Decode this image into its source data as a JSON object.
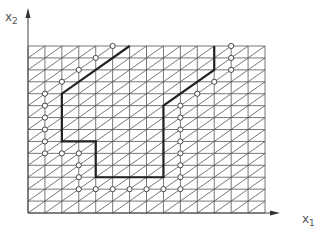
{
  "diagram": {
    "type": "triangulated-grid-with-path",
    "axes": {
      "x_label": "x",
      "x_sub": "1",
      "y_label": "x",
      "y_sub": "2",
      "origin": [
        28,
        213
      ],
      "x_end": 280,
      "y_end": 8
    },
    "grid": {
      "x0": 28,
      "y0": 46,
      "cols": 14,
      "rows": 14,
      "cell_w": 16.93,
      "cell_h": 11.93,
      "line_color": "#555555",
      "diagonal": "bottom-left-to-top-right"
    },
    "path": {
      "color": "#222222",
      "points_grid": [
        [
          6,
          0
        ],
        [
          2,
          4
        ],
        [
          2,
          8
        ],
        [
          4,
          8
        ],
        [
          4,
          11
        ],
        [
          8,
          11
        ],
        [
          8,
          5
        ],
        [
          11,
          2
        ],
        [
          11,
          0
        ]
      ]
    },
    "markers": {
      "style": "open-circle",
      "points_grid": [
        [
          5,
          0
        ],
        [
          4,
          1
        ],
        [
          3,
          2
        ],
        [
          2,
          3
        ],
        [
          1,
          4
        ],
        [
          1,
          5
        ],
        [
          1,
          6
        ],
        [
          1,
          7
        ],
        [
          1,
          8
        ],
        [
          1,
          9
        ],
        [
          2,
          9
        ],
        [
          3,
          9
        ],
        [
          3,
          10
        ],
        [
          3,
          11
        ],
        [
          3,
          12
        ],
        [
          4,
          12
        ],
        [
          5,
          12
        ],
        [
          6,
          12
        ],
        [
          7,
          12
        ],
        [
          8,
          12
        ],
        [
          9,
          12
        ],
        [
          9,
          11
        ],
        [
          9,
          10
        ],
        [
          9,
          9
        ],
        [
          9,
          8
        ],
        [
          9,
          7
        ],
        [
          9,
          6
        ],
        [
          9,
          5
        ],
        [
          10,
          4
        ],
        [
          11,
          3
        ],
        [
          12,
          2
        ],
        [
          12,
          1
        ],
        [
          12,
          0
        ]
      ]
    }
  }
}
